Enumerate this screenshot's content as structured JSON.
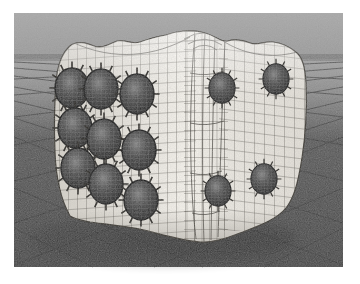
{
  "meta": {
    "visible_text": "none"
  },
  "canvas": {
    "width": 360,
    "height": 284,
    "background": "#ffffff"
  },
  "scene": {
    "x": 14,
    "y": 13,
    "width": 329,
    "height": 254,
    "horizon_y": 46
  },
  "colors": {
    "border": "#ffffff",
    "sky_top": "#a7a7a7",
    "sky_bottom": "#989898",
    "horizon_band": "#7d7d7d",
    "ground_far": "#a2a2a2",
    "ground_mid": "#898989",
    "floor_dark": "#575757",
    "floor_near": "#464646",
    "floor_grid_line": "#363636",
    "die_left_shade": "#d5d1c8",
    "die_surface": "#eeebe4",
    "die_highlight": "#f8f5ee",
    "die_right_shade": "#e3dfd7",
    "mesh_line": "#35322c",
    "pip_core": "#181818",
    "pip_mid": "#4a4a4a",
    "pip_sheen": "#7e7e7e",
    "pip_wire": "#9a9a9a",
    "pip_spike": "#262420",
    "shadow": "#2d2d2d"
  },
  "die": {
    "object": "rounded cube die with quad wireframe mesh and displaced pip craters",
    "faces_visible": 3,
    "left_face_pip_count": 9,
    "right_face_pip_count": 4,
    "pip_size_left": {
      "rx": 17,
      "ry": 20
    },
    "pip_size_right": {
      "rx": 13,
      "ry": 15
    },
    "pips": {
      "left": [
        {
          "x": 58,
          "y": 75
        },
        {
          "x": 87,
          "y": 76
        },
        {
          "x": 123,
          "y": 81
        },
        {
          "x": 61,
          "y": 115
        },
        {
          "x": 90,
          "y": 126
        },
        {
          "x": 125,
          "y": 137
        },
        {
          "x": 64,
          "y": 155
        },
        {
          "x": 92,
          "y": 171
        },
        {
          "x": 127,
          "y": 187
        }
      ],
      "right": [
        {
          "x": 208,
          "y": 75
        },
        {
          "x": 262,
          "y": 66
        },
        {
          "x": 204,
          "y": 178
        },
        {
          "x": 250,
          "y": 166
        }
      ]
    }
  },
  "floor": {
    "pattern": "two-point perspective diamond tile grid"
  }
}
